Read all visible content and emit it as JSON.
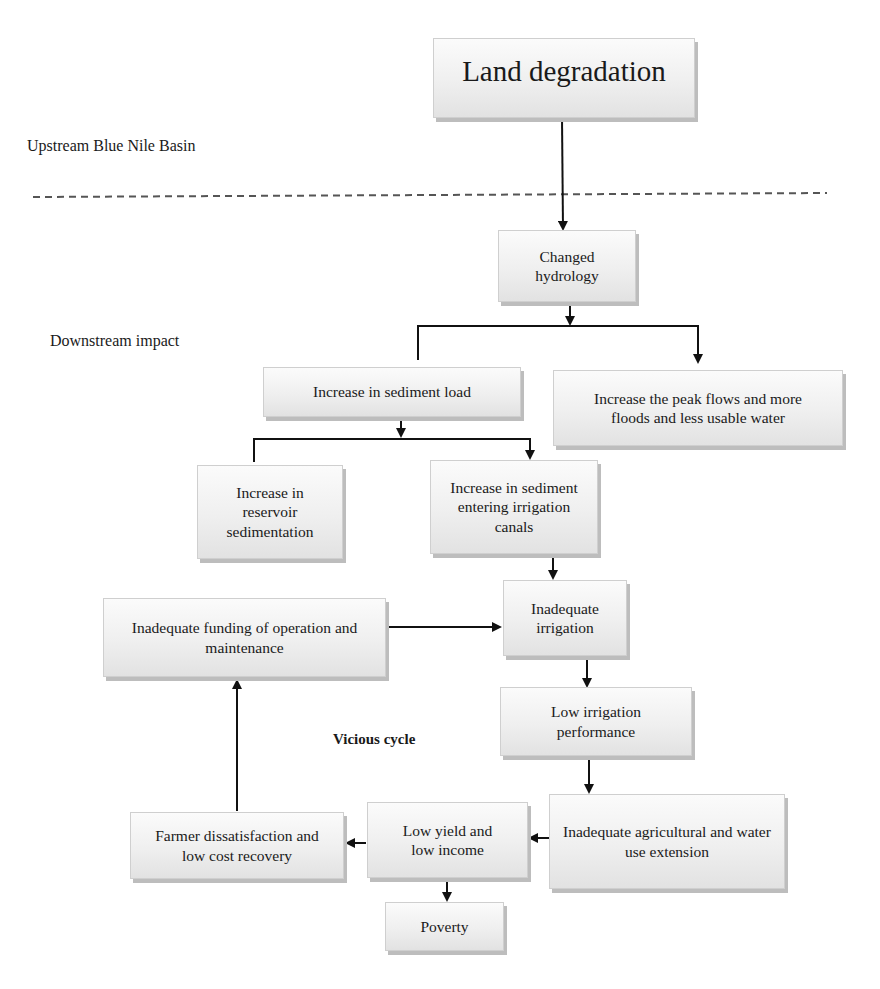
{
  "region_labels": {
    "upstream": "Upstream Blue Nile Basin",
    "downstream": "Downstream impact",
    "cycle": "Vicious cycle"
  },
  "nodes": {
    "land_degradation": "Land degradation",
    "changed_hydrology": "Changed hydrology",
    "sediment_load": "Increase in sediment load",
    "peak_flows": "Increase the peak flows and more floods and less usable water",
    "reservoir_sedimentation": "Increase in reservoir sedimentation",
    "sediment_canals": "Increase in sediment entering irrigation canals",
    "inadequate_irrigation": "Inadequate irrigation",
    "funding": "Inadequate funding of operation and maintenance",
    "low_performance": "Low irrigation performance",
    "extension": "Inadequate agricultural and water use extension",
    "low_yield": "Low yield and low income",
    "farmer_dissatisfaction": "Farmer dissatisfaction and low cost recovery",
    "poverty": "Poverty"
  },
  "edges": [
    [
      "land_degradation",
      "changed_hydrology"
    ],
    [
      "changed_hydrology",
      "sediment_load"
    ],
    [
      "changed_hydrology",
      "peak_flows"
    ],
    [
      "sediment_load",
      "reservoir_sedimentation"
    ],
    [
      "sediment_load",
      "sediment_canals"
    ],
    [
      "sediment_canals",
      "inadequate_irrigation"
    ],
    [
      "funding",
      "inadequate_irrigation"
    ],
    [
      "inadequate_irrigation",
      "low_performance"
    ],
    [
      "low_performance",
      "extension"
    ],
    [
      "extension",
      "low_yield"
    ],
    [
      "low_yield",
      "farmer_dissatisfaction"
    ],
    [
      "low_yield",
      "poverty"
    ],
    [
      "farmer_dissatisfaction",
      "funding"
    ]
  ],
  "colors": {
    "line": "#111111",
    "dash": "#555555",
    "box_shadow": "#bdbdbd"
  }
}
